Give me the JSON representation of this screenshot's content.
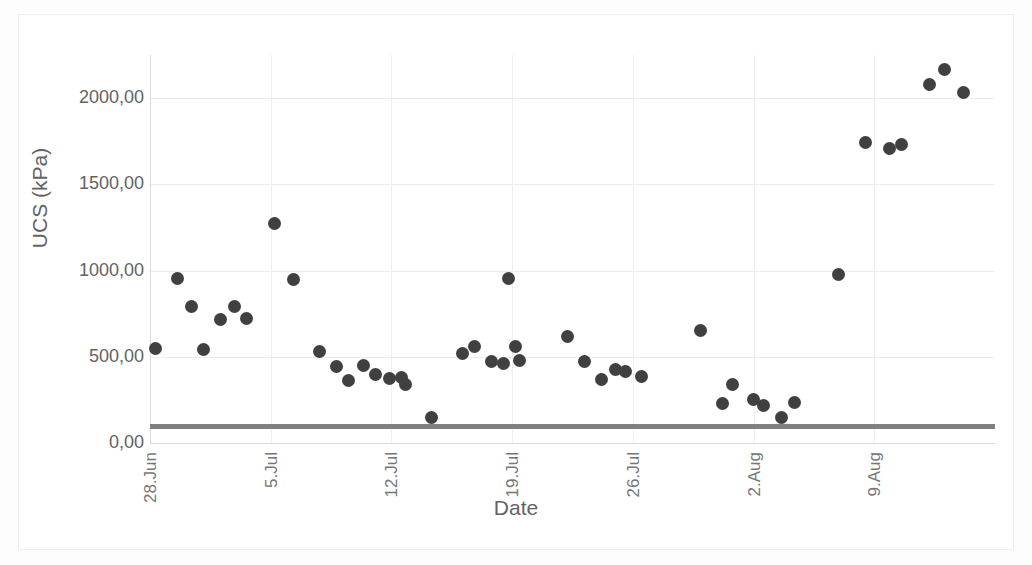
{
  "chart_data": {
    "type": "scatter",
    "title": "",
    "xlabel": "Date",
    "ylabel": "UCS (kPa)",
    "ylim": [
      0,
      2250
    ],
    "yticks": [
      0,
      500,
      1000,
      1500,
      2000
    ],
    "ytick_labels": [
      "0,00",
      "500,00",
      "1000,00",
      "1500,00",
      "2000,00"
    ],
    "xlim_days": [
      0,
      49
    ],
    "xticks_days": [
      0,
      7,
      14,
      21,
      28,
      35,
      42
    ],
    "xtick_labels": [
      "28.Jun",
      "5.Jul",
      "12.Jul",
      "19.Jul",
      "26.Jul",
      "2.Aug",
      "9.Aug"
    ],
    "grid": "both",
    "legend": "none",
    "marker_color": "#404040",
    "marker_shape": "circle",
    "threshold_line": {
      "value": 100,
      "color": "#808080",
      "label": ""
    },
    "series": [
      {
        "name": "UCS",
        "points": [
          {
            "x_day": 0.3,
            "y": 550
          },
          {
            "x_day": 1.6,
            "y": 955
          },
          {
            "x_day": 2.4,
            "y": 790
          },
          {
            "x_day": 3.1,
            "y": 540
          },
          {
            "x_day": 4.1,
            "y": 715
          },
          {
            "x_day": 4.9,
            "y": 790
          },
          {
            "x_day": 5.6,
            "y": 720
          },
          {
            "x_day": 7.2,
            "y": 1270
          },
          {
            "x_day": 8.3,
            "y": 950
          },
          {
            "x_day": 9.8,
            "y": 530
          },
          {
            "x_day": 10.8,
            "y": 445
          },
          {
            "x_day": 11.5,
            "y": 365
          },
          {
            "x_day": 12.4,
            "y": 450
          },
          {
            "x_day": 13.1,
            "y": 400
          },
          {
            "x_day": 13.9,
            "y": 375
          },
          {
            "x_day": 14.6,
            "y": 380
          },
          {
            "x_day": 14.8,
            "y": 340
          },
          {
            "x_day": 16.3,
            "y": 150
          },
          {
            "x_day": 18.1,
            "y": 520
          },
          {
            "x_day": 18.8,
            "y": 560
          },
          {
            "x_day": 19.8,
            "y": 470
          },
          {
            "x_day": 20.5,
            "y": 460
          },
          {
            "x_day": 20.8,
            "y": 955
          },
          {
            "x_day": 21.2,
            "y": 560
          },
          {
            "x_day": 21.4,
            "y": 480
          },
          {
            "x_day": 24.2,
            "y": 620
          },
          {
            "x_day": 25.2,
            "y": 470
          },
          {
            "x_day": 26.2,
            "y": 370
          },
          {
            "x_day": 27.0,
            "y": 425
          },
          {
            "x_day": 27.6,
            "y": 415
          },
          {
            "x_day": 28.5,
            "y": 385
          },
          {
            "x_day": 31.9,
            "y": 650
          },
          {
            "x_day": 33.2,
            "y": 230
          },
          {
            "x_day": 33.8,
            "y": 340
          },
          {
            "x_day": 35.0,
            "y": 255
          },
          {
            "x_day": 35.6,
            "y": 215
          },
          {
            "x_day": 36.6,
            "y": 145
          },
          {
            "x_day": 37.4,
            "y": 235
          },
          {
            "x_day": 39.9,
            "y": 975
          },
          {
            "x_day": 41.5,
            "y": 1740
          },
          {
            "x_day": 42.9,
            "y": 1705
          },
          {
            "x_day": 43.6,
            "y": 1730
          },
          {
            "x_day": 45.2,
            "y": 2080
          },
          {
            "x_day": 46.1,
            "y": 2165
          },
          {
            "x_day": 47.2,
            "y": 2030
          }
        ]
      }
    ]
  }
}
